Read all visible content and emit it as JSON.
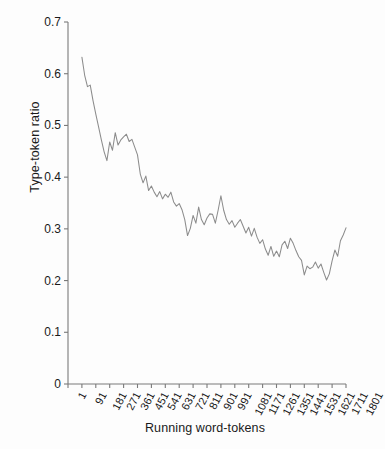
{
  "chart_data": {
    "type": "line",
    "title": "",
    "xlabel": "Running word-tokens",
    "ylabel": "Type-token ratio",
    "ylim": [
      0,
      0.7
    ],
    "xlim": [
      1,
      1801
    ],
    "grid": false,
    "legend": "none",
    "line_color": "#8c8c8c",
    "y_ticks": [
      "0",
      "0.1",
      "0.2",
      "0.3",
      "0.4",
      "0.5",
      "0.6",
      "0.7"
    ],
    "y_tick_values": [
      0,
      0.1,
      0.2,
      0.3,
      0.4,
      0.5,
      0.6,
      0.7
    ],
    "x_ticks": [
      "1",
      "91",
      "181",
      "271",
      "361",
      "451",
      "541",
      "631",
      "721",
      "811",
      "901",
      "991",
      "1081",
      "1171",
      "1261",
      "1351",
      "1441",
      "1531",
      "1621",
      "1711",
      "1801"
    ],
    "x_tick_values": [
      1,
      91,
      181,
      271,
      361,
      451,
      541,
      631,
      721,
      811,
      901,
      991,
      1081,
      1171,
      1261,
      1351,
      1441,
      1531,
      1621,
      1711,
      1801
    ],
    "series": [
      {
        "name": "Type-token ratio",
        "x": [
          91,
          109,
          127,
          145,
          163,
          181,
          199,
          217,
          235,
          253,
          271,
          289,
          307,
          325,
          343,
          361,
          379,
          397,
          415,
          433,
          451,
          469,
          487,
          505,
          523,
          541,
          559,
          577,
          595,
          613,
          631,
          649,
          667,
          685,
          703,
          721,
          739,
          757,
          775,
          793,
          811,
          829,
          847,
          865,
          883,
          901,
          919,
          937,
          955,
          973,
          991,
          1009,
          1027,
          1045,
          1063,
          1081,
          1099,
          1117,
          1135,
          1153,
          1171,
          1189,
          1207,
          1225,
          1243,
          1261,
          1279,
          1297,
          1315,
          1333,
          1351,
          1369,
          1387,
          1405,
          1423,
          1441,
          1459,
          1477,
          1495,
          1513,
          1531,
          1549,
          1567,
          1585,
          1603,
          1621,
          1639,
          1657,
          1675,
          1693,
          1711,
          1729,
          1747
        ],
        "values": [
          0.632,
          0.597,
          0.575,
          0.578,
          0.548,
          0.522,
          0.497,
          0.472,
          0.449,
          0.432,
          0.468,
          0.452,
          0.486,
          0.462,
          0.472,
          0.478,
          0.483,
          0.469,
          0.473,
          0.458,
          0.443,
          0.406,
          0.389,
          0.402,
          0.374,
          0.383,
          0.371,
          0.362,
          0.372,
          0.358,
          0.367,
          0.361,
          0.371,
          0.352,
          0.344,
          0.349,
          0.337,
          0.318,
          0.287,
          0.301,
          0.326,
          0.311,
          0.342,
          0.318,
          0.308,
          0.321,
          0.329,
          0.328,
          0.311,
          0.336,
          0.364,
          0.336,
          0.318,
          0.309,
          0.316,
          0.303,
          0.311,
          0.318,
          0.305,
          0.292,
          0.303,
          0.286,
          0.301,
          0.284,
          0.272,
          0.279,
          0.261,
          0.249,
          0.266,
          0.247,
          0.257,
          0.246,
          0.269,
          0.276,
          0.262,
          0.282,
          0.272,
          0.258,
          0.246,
          0.239,
          0.211,
          0.228,
          0.223,
          0.226,
          0.236,
          0.224,
          0.232,
          0.216,
          0.201,
          0.213,
          0.238,
          0.259,
          0.247
        ]
      },
      {
        "name": "Type-token ratio (continued)",
        "x": [
          1765,
          1783,
          1801
        ],
        "values": [
          0.277,
          0.288,
          0.302
        ]
      }
    ],
    "points_px": "polyline in figure coordinates"
  },
  "axes": {
    "y_axis_name": "Type-token ratio",
    "x_axis_name": "Running word-tokens"
  }
}
